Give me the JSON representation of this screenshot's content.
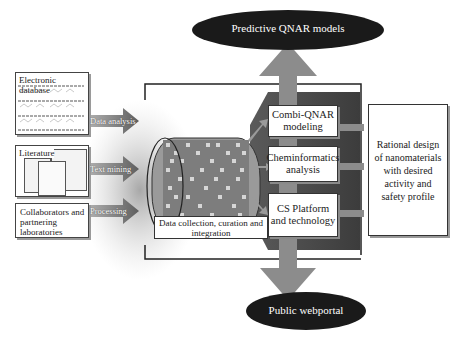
{
  "top_output": {
    "label": "Predictive QNAR models"
  },
  "bottom_output": {
    "label": "Public webportal"
  },
  "sources": [
    {
      "label": "Electronic database",
      "arrow_label": "Data analysis"
    },
    {
      "label": "Literature",
      "arrow_label": "Text mining"
    },
    {
      "label": "Collaborators and partnering laboratories",
      "arrow_label": "Processing"
    }
  ],
  "hub": {
    "label": "Data collection, curation and integration"
  },
  "methods": [
    {
      "label": "Combi-QNAR modeling"
    },
    {
      "label": "Cheminformatics analysis"
    },
    {
      "label": "CS Platform and technology"
    }
  ],
  "result": {
    "label": "Rational design of nanomaterials with desired activity and safety profile"
  },
  "colors": {
    "ellipse": "#1a1a1a",
    "big_arrow": "#8c8c8c",
    "funnel": "#6e6e6e",
    "haze": "#bfbfbf",
    "frame": "#222222"
  }
}
